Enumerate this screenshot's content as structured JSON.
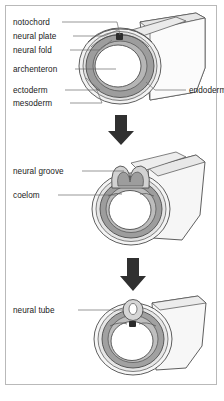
{
  "figure": {
    "background_color": "#ffffff",
    "frame_border_color": "#b9b9b9",
    "text_color": "#1a1a1a"
  },
  "palette": {
    "ectoderm_fill": "#f2f2f2",
    "mesoderm_fill": "#9d9d9d",
    "mesoderm_light_fill": "#c9c9c9",
    "endoderm_fill": "#dcdcdc",
    "archenteron_fill": "#ffffff",
    "notochord_fill": "#2b2b2b",
    "body_tube_fill": "#f4f4f4",
    "body_tube_shade": "#e3e3e3",
    "outline": "#4d4d4d",
    "leader_line": "#6b6b6b",
    "arrow_fill": "#303030"
  },
  "stages": [
    {
      "id": "stage-1",
      "name": "neural-plate-stage",
      "labels_left": [
        {
          "name": "notochord",
          "text": "notochord"
        },
        {
          "name": "neural-plate",
          "text": "neural plate"
        },
        {
          "name": "neural-fold",
          "text": "neural fold"
        },
        {
          "name": "archenteron",
          "text": "archenteron"
        },
        {
          "name": "ectoderm",
          "text": "ectoderm"
        },
        {
          "name": "mesoderm",
          "text": "mesoderm"
        }
      ],
      "labels_right": [
        {
          "name": "endoderm",
          "text": "endoderm"
        }
      ]
    },
    {
      "id": "stage-2",
      "name": "neural-groove-stage",
      "labels_left": [
        {
          "name": "neural-groove",
          "text": "neural groove"
        },
        {
          "name": "coelom",
          "text": "coelom"
        }
      ],
      "labels_right": []
    },
    {
      "id": "stage-3",
      "name": "neural-tube-stage",
      "labels_left": [
        {
          "name": "neural-tube",
          "text": "neural tube"
        }
      ],
      "labels_right": []
    }
  ],
  "arrows": [
    {
      "name": "arrow-stage1-to-stage2",
      "direction": "down"
    },
    {
      "name": "arrow-stage2-to-stage3",
      "direction": "down"
    }
  ]
}
